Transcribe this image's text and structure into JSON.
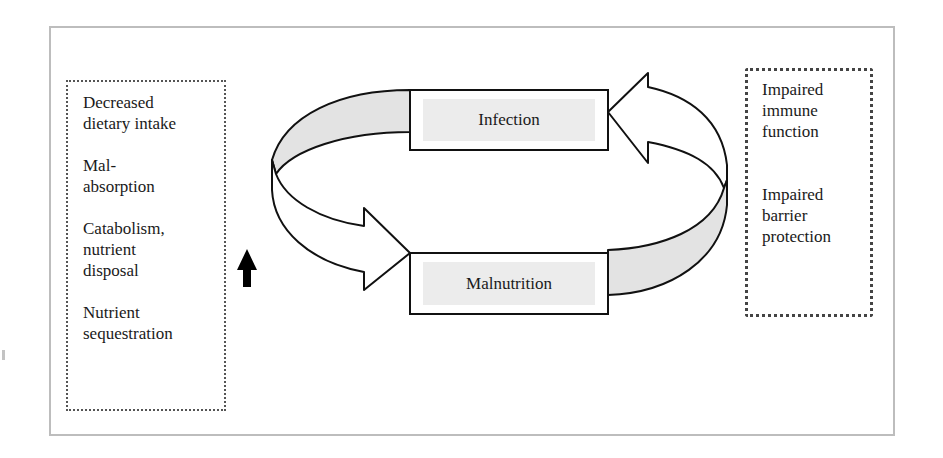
{
  "diagram": {
    "left_box": {
      "items": [
        "Decreased\ndietary intake",
        "Mal-\nabsorption",
        "Catabolism,\nnutrient\ndisposal",
        "Nutrient\nsequestration"
      ]
    },
    "right_box": {
      "items": [
        "Impaired\nimmune\nfunction",
        "Impaired\nbarrier\nprotection"
      ]
    },
    "nodes": {
      "infection": "Infection",
      "malnutrition": "Malnutrition"
    },
    "edges": [
      {
        "from": "infection",
        "to": "malnutrition",
        "style": "curved-ribbon-arrow",
        "side": "left"
      },
      {
        "from": "malnutrition",
        "to": "infection",
        "style": "curved-ribbon-arrow",
        "side": "right"
      }
    ],
    "indicator": {
      "icon": "up-arrow-icon",
      "meaning": "increase"
    },
    "colors": {
      "ribbon_shade": "#e3e3e3",
      "node_fill": "#ececec",
      "stroke": "#111111",
      "frame": "#bdbdbd"
    }
  }
}
